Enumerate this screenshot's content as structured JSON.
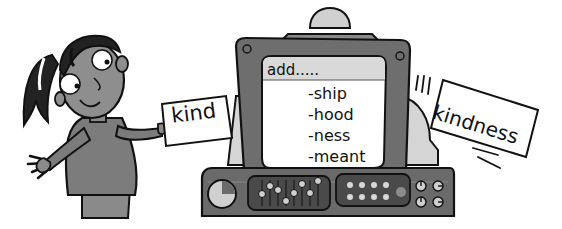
{
  "illustration": {
    "description": "Girl holding a word card next to a suffix-adding computer that outputs a new word",
    "girl": {
      "card_word": "kind"
    },
    "computer": {
      "screen": {
        "header": "add.....",
        "suffixes": [
          "-ship",
          "-hood",
          "-ness",
          "-meant"
        ]
      }
    },
    "output_card": {
      "word": "kindness"
    }
  },
  "colors": {
    "outline": "#111111",
    "dark_gray": "#6a6a6a",
    "mid_gray": "#8c8c8c",
    "light_gray": "#cfcfcf",
    "screen_header": "#d9d9d9",
    "white": "#ffffff",
    "panel_dark": "#4a4a4a",
    "light_dot": "#d8d8d8"
  }
}
